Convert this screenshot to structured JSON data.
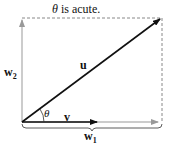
{
  "title": {
    "theta": "θ",
    "rest": " is acute."
  },
  "labels": {
    "u": "u",
    "v": "v",
    "w1": "w",
    "w1_sub": "1",
    "w2": "w",
    "w2_sub": "2",
    "theta": "θ"
  },
  "colors": {
    "dark": "#111111",
    "gray": "#999999"
  }
}
